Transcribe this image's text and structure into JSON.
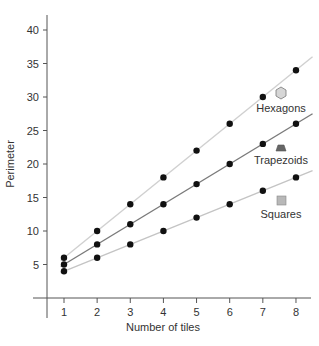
{
  "chart_data": {
    "type": "line",
    "title": "",
    "xlabel": "Number of tiles",
    "ylabel": "Perimeter",
    "x": [
      1,
      2,
      3,
      4,
      5,
      6,
      7,
      8
    ],
    "xticks": [
      1,
      2,
      3,
      4,
      5,
      6,
      7,
      8
    ],
    "yticks": [
      5,
      10,
      15,
      20,
      25,
      30,
      35,
      40
    ],
    "xlim": [
      0.5,
      8.5
    ],
    "ylim": [
      0,
      40
    ],
    "grid": false,
    "legend_position": "inline-right",
    "series": [
      {
        "name": "Hexagons",
        "values": [
          6,
          10,
          14,
          18,
          22,
          26,
          30,
          34
        ],
        "line_color": "#d0d0d0",
        "marker": "hexagon",
        "marker_fill": "#d6d6d6"
      },
      {
        "name": "Trapezoids",
        "values": [
          5,
          8,
          11,
          14,
          17,
          20,
          23,
          26
        ],
        "line_color": "#7a7a7a",
        "marker": "trapezoid",
        "marker_fill": "#666666"
      },
      {
        "name": "Squares",
        "values": [
          4,
          6,
          8,
          10,
          12,
          14,
          16,
          18
        ],
        "line_color": "#c4c4c4",
        "marker": "square",
        "marker_fill": "#b8b8b8"
      }
    ],
    "point_color": "#111111"
  }
}
